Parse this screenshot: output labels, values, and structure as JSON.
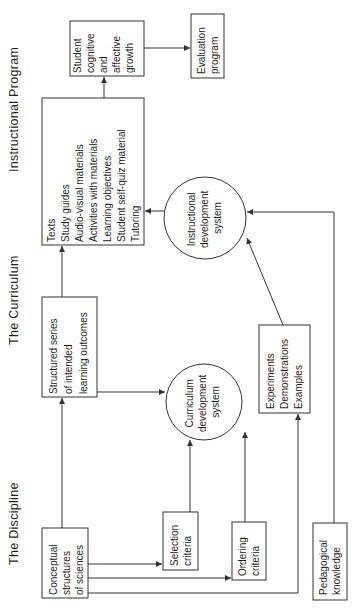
{
  "columns": {
    "discipline": "The Discipline",
    "curriculum": "The Curriculum",
    "instructional": "Instructional Program"
  },
  "nodes": {
    "conceptual": [
      "Conceptual",
      "structures",
      "of sciences"
    ],
    "selection": [
      "Selection",
      "criteria"
    ],
    "ordering": [
      "Ordering",
      "criteria"
    ],
    "pedagogical": [
      "Pedagogical",
      "knowledge"
    ],
    "structured": [
      "Structured series",
      "of intended",
      "learning outcomes"
    ],
    "curriculum_system": [
      "Curriculum",
      "development",
      "system"
    ],
    "experiments": [
      "Experiments",
      "Demonstrations",
      "Examples"
    ],
    "texts": [
      "Texts",
      "Study guides",
      "Audio-visual materials",
      "Activities with materials",
      "Learning objectives",
      "Student self-quiz material",
      "Tutoring"
    ],
    "instructional_system": [
      "Instructional",
      "development",
      "system"
    ],
    "student_growth": [
      "Student",
      "cognitive",
      "and",
      "affective",
      "growth"
    ],
    "evaluation": [
      "Evaluation",
      "program"
    ]
  },
  "colors": {
    "stroke": "#333333",
    "text": "#1f1f1f",
    "background": "#ffffff"
  }
}
